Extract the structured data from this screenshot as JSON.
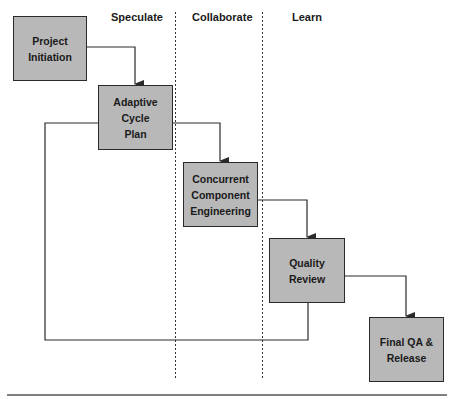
{
  "phases": [
    {
      "id": "speculate",
      "label": "Speculate"
    },
    {
      "id": "collaborate",
      "label": "Collaborate"
    },
    {
      "id": "learn",
      "label": "Learn"
    }
  ],
  "nodes": [
    {
      "id": "project-initiation",
      "label": "Project\nInitiation",
      "phase": "speculate"
    },
    {
      "id": "adaptive-cycle-plan",
      "label": "Adaptive\nCycle\nPlan",
      "phase": "speculate"
    },
    {
      "id": "concurrent-component-engineering",
      "label": "Concurrent\nComponent\nEngineering",
      "phase": "collaborate"
    },
    {
      "id": "quality-review",
      "label": "Quality\nReview",
      "phase": "learn"
    },
    {
      "id": "final-qa-release",
      "label": "Final QA &\nRelease",
      "phase": "learn"
    }
  ],
  "edges": [
    {
      "from": "project-initiation",
      "to": "adaptive-cycle-plan",
      "type": "arrow"
    },
    {
      "from": "adaptive-cycle-plan",
      "to": "concurrent-component-engineering",
      "type": "arrow"
    },
    {
      "from": "concurrent-component-engineering",
      "to": "quality-review",
      "type": "arrow"
    },
    {
      "from": "quality-review",
      "to": "final-qa-release",
      "type": "arrow"
    },
    {
      "from": "quality-review",
      "to": "adaptive-cycle-plan",
      "type": "feedback-loop"
    }
  ],
  "colors": {
    "box_fill": "#b8b8b8",
    "box_border": "#2a2a2a",
    "line": "#2a2a2a",
    "phase_divider": "#333333",
    "background": "#ffffff"
  }
}
